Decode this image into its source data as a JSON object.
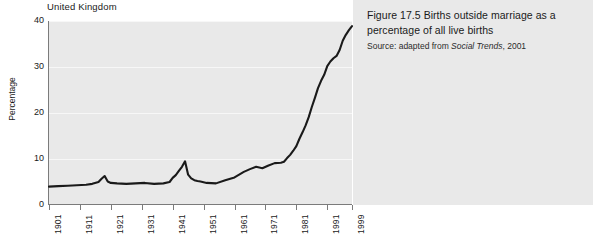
{
  "chart": {
    "country_label": "United Kingdom",
    "y_axis_title": "Percentage"
  },
  "caption": {
    "title": "Figure 17.5  Births outside marriage as a percentage of all live births",
    "source_prefix": "Source: adapted from ",
    "source_italic": "Social Trends",
    "source_suffix": ", 2001"
  },
  "chart_data": {
    "type": "line",
    "title": "Births outside marriage as a percentage of all live births",
    "subtitle": "United Kingdom",
    "xlabel": "",
    "ylabel": "Percentage",
    "xlim": [
      1901,
      1999
    ],
    "ylim": [
      0,
      40
    ],
    "yticks": [
      0,
      10,
      20,
      30,
      40
    ],
    "xticks": [
      1901,
      1911,
      1921,
      1931,
      1941,
      1951,
      1961,
      1971,
      1981,
      1991,
      1999
    ],
    "grid": true,
    "legend": "none",
    "line_color": "#1a1a1a",
    "plot_background": "#e9e9e9",
    "series": [
      {
        "name": "Births outside marriage (% of all live births)",
        "x": [
          1901,
          1904,
          1907,
          1910,
          1913,
          1915,
          1917,
          1918,
          1919,
          1920,
          1921,
          1923,
          1926,
          1929,
          1932,
          1935,
          1938,
          1940,
          1941,
          1942,
          1943,
          1944,
          1945,
          1946,
          1947,
          1948,
          1949,
          1950,
          1952,
          1955,
          1958,
          1961,
          1964,
          1966,
          1968,
          1970,
          1972,
          1974,
          1976,
          1977,
          1978,
          1979,
          1980,
          1981,
          1982,
          1983,
          1984,
          1985,
          1986,
          1987,
          1988,
          1989,
          1990,
          1991,
          1992,
          1993,
          1994,
          1995,
          1996,
          1997,
          1998,
          1999
        ],
        "y": [
          4.0,
          4.1,
          4.2,
          4.3,
          4.4,
          4.6,
          5.0,
          5.7,
          6.3,
          5.1,
          4.8,
          4.7,
          4.6,
          4.7,
          4.8,
          4.6,
          4.7,
          5.0,
          5.9,
          6.5,
          7.4,
          8.3,
          9.5,
          6.6,
          5.8,
          5.4,
          5.2,
          5.1,
          4.8,
          4.7,
          5.4,
          6.0,
          7.2,
          7.8,
          8.3,
          8.0,
          8.6,
          9.1,
          9.2,
          9.4,
          10.2,
          10.9,
          11.8,
          12.8,
          14.4,
          15.8,
          17.3,
          19.1,
          21.3,
          23.3,
          25.4,
          27.0,
          28.3,
          30.2,
          31.2,
          31.9,
          32.4,
          33.7,
          35.7,
          37.0,
          38.0,
          38.9
        ]
      }
    ]
  }
}
